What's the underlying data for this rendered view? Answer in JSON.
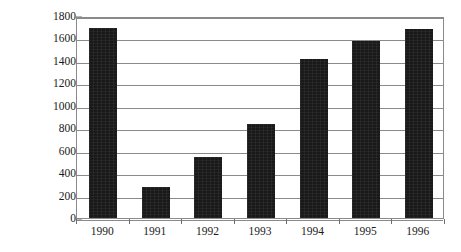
{
  "chart_data": {
    "type": "bar",
    "title": "",
    "subtitle": "",
    "xlabel": "",
    "ylabel": "billion USD",
    "categories": [
      "1990",
      "1991",
      "1992",
      "1993",
      "1994",
      "1995",
      "1996"
    ],
    "values": [
      1690,
      275,
      545,
      835,
      1420,
      1580,
      1680
    ],
    "series": [
      {
        "name": "billion USD",
        "values": [
          1690,
          275,
          545,
          835,
          1420,
          1580,
          1680
        ]
      }
    ],
    "ylim": [
      0,
      1800
    ],
    "y_ticks": [
      0,
      200,
      400,
      600,
      800,
      1000,
      1200,
      1400,
      1600,
      1800
    ],
    "y_tick_labels": [
      "0",
      "200",
      "400",
      "600",
      "800",
      "1000",
      "1200",
      "1400",
      "1600",
      "1800"
    ],
    "grid": true,
    "grid_axis": "y",
    "legend": false,
    "legend_position": "none",
    "bar_color": "#191919",
    "grid_color": "#8a8a8a",
    "axis_color": "#6f6f6f",
    "text_color": "#1a1a1a",
    "background": "#ffffff",
    "annotations": []
  }
}
